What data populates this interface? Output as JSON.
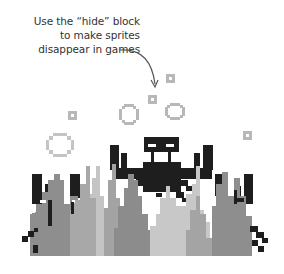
{
  "callout": {
    "lines": [
      "Use the “hide” block",
      "to make sprites",
      "disappear in games"
    ]
  },
  "scene": {
    "description": "Pixel-art crab sprite behind grey seaweed with floating bubbles",
    "colors": {
      "background": "#ffffff",
      "crab": "#1e1e1e",
      "bubble": "#b8b8b8",
      "weed_dark": "#8c8c8c",
      "weed_mid": "#a3a3a3",
      "weed_light": "#c6c6c6",
      "arrow": "#555555",
      "text": "#333333"
    }
  }
}
